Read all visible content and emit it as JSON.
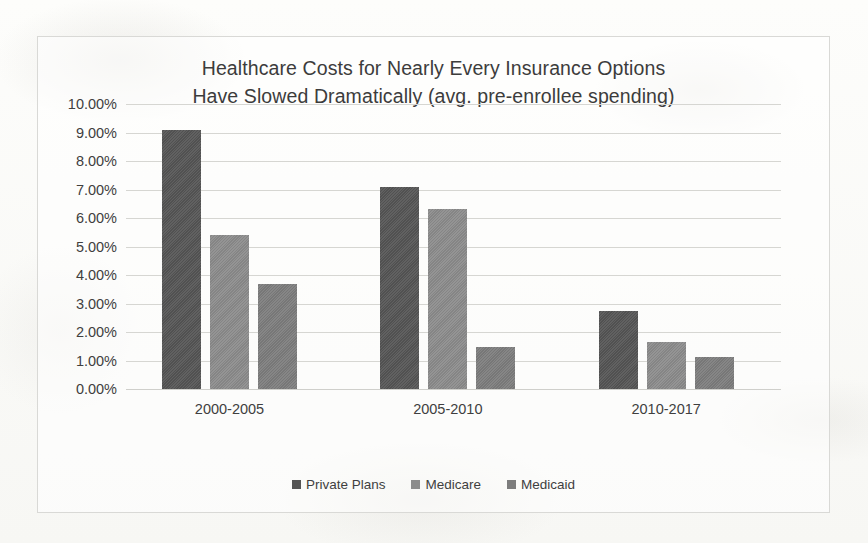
{
  "chart_data": {
    "type": "bar",
    "title": "Healthcare Costs for Nearly Every Insurance Options\nHave Slowed Dramatically (avg. pre-enrollee spending)",
    "title_line1": "Healthcare Costs for Nearly Every Insurance Options",
    "title_line2": "Have Slowed Dramatically (avg. pre-enrollee spending)",
    "xlabel": "",
    "ylabel": "",
    "categories": [
      "2000-2005",
      "2005-2010",
      "2010-2017"
    ],
    "series": [
      {
        "name": "Private Plans",
        "color": "#555555",
        "values": [
          9.1,
          7.08,
          2.75
        ]
      },
      {
        "name": "Medicare",
        "color": "#8c8c8c",
        "values": [
          5.4,
          6.33,
          1.65
        ]
      },
      {
        "name": "Medicaid",
        "color": "#7d7d7d",
        "values": [
          3.68,
          1.47,
          1.13
        ]
      }
    ],
    "ylim": [
      0,
      10
    ],
    "ytick_step": 1,
    "ytick_labels": [
      "10.00%",
      "9.00%",
      "8.00%",
      "7.00%",
      "6.00%",
      "5.00%",
      "4.00%",
      "3.00%",
      "2.00%",
      "1.00%",
      "0.00%"
    ],
    "ytick_values": [
      10,
      9,
      8,
      7,
      6,
      5,
      4,
      3,
      2,
      1,
      0
    ],
    "grid": true,
    "grid_axis": "y",
    "legend_position": "bottom",
    "value_format": "percent"
  },
  "frame": {
    "border_color": "#d9d9d6",
    "background": "#fbfbf9"
  }
}
